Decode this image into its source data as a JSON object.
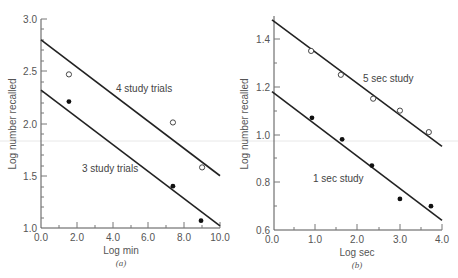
{
  "chart_data": [
    {
      "panel": "a",
      "caption": "(a)",
      "type": "scatter",
      "xlabel": "Log min",
      "ylabel": "Log number recalled",
      "xlim": [
        0.0,
        10.0
      ],
      "ylim": [
        1.0,
        3.0
      ],
      "xticks": [
        "0.0",
        "2.0",
        "4.0",
        "6.0",
        "8.0",
        "10.0"
      ],
      "yticks": [
        "1.0",
        "1.5",
        "2.0",
        "2.5",
        "3.0"
      ],
      "grid": false,
      "series": [
        {
          "name": "4 study trials",
          "marker": "open-circle",
          "points": [
            [
              1.56,
              2.47
            ],
            [
              7.37,
              2.01
            ],
            [
              9.0,
              1.58
            ]
          ],
          "fit_line": [
            [
              0.0,
              2.8
            ],
            [
              10.0,
              1.5
            ]
          ]
        },
        {
          "name": "3 study trials",
          "marker": "filled-circle",
          "points": [
            [
              1.56,
              2.21
            ],
            [
              7.37,
              1.4
            ],
            [
              8.94,
              1.07
            ]
          ],
          "fit_line": [
            [
              0.0,
              2.32
            ],
            [
              10.0,
              1.02
            ]
          ]
        }
      ]
    },
    {
      "panel": "b",
      "caption": "(b)",
      "type": "scatter",
      "xlabel": "Log sec",
      "ylabel": "Log number recalled",
      "xlim": [
        0.0,
        4.0
      ],
      "ylim": [
        0.6,
        1.5
      ],
      "xticks": [
        "0.0",
        "1.0",
        "2.0",
        "3.0",
        "4.0"
      ],
      "yticks": [
        "0.6",
        "0.8",
        "1.0",
        "1.2",
        "1.4"
      ],
      "grid": false,
      "series": [
        {
          "name": "5 sec study",
          "marker": "open-circle",
          "points": [
            [
              0.92,
              1.35
            ],
            [
              1.62,
              1.25
            ],
            [
              2.38,
              1.15
            ],
            [
              3.01,
              1.1
            ],
            [
              3.69,
              1.01
            ]
          ],
          "fit_line": [
            [
              0.0,
              1.48
            ],
            [
              4.0,
              0.95
            ]
          ]
        },
        {
          "name": "1 sec study",
          "marker": "filled-circle",
          "points": [
            [
              0.94,
              1.07
            ],
            [
              1.65,
              0.98
            ],
            [
              2.35,
              0.87
            ],
            [
              3.01,
              0.73
            ],
            [
              3.74,
              0.7
            ]
          ],
          "fit_line": [
            [
              0.0,
              1.18
            ],
            [
              4.0,
              0.64
            ]
          ]
        }
      ]
    }
  ],
  "labels": {
    "a": {
      "caption": "(a)",
      "xlabel": "Log min",
      "ylabel": "Log number recalled",
      "series_top": "4 study trials",
      "series_bottom": "3 study trials",
      "xticks": [
        "0.0",
        "2.0",
        "4.0",
        "6.0",
        "8.0",
        "10.0"
      ],
      "yticks": [
        "1.0",
        "1.5",
        "2.0",
        "2.5",
        "3.0"
      ]
    },
    "b": {
      "caption": "(b)",
      "xlabel": "Log sec",
      "ylabel": "Log number recalled",
      "series_top": "5 sec study",
      "series_bottom": "1 sec study",
      "xticks": [
        "0.0",
        "1.0",
        "2.0",
        "3.0",
        "4.0"
      ],
      "yticks": [
        "0.6",
        "0.8",
        "1.0",
        "1.2",
        "1.4"
      ]
    }
  }
}
